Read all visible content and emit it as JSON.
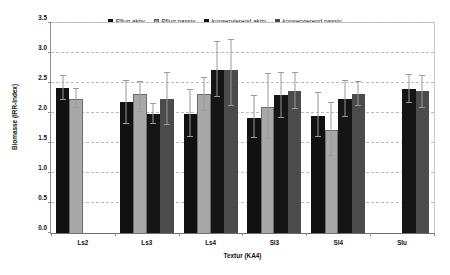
{
  "chart_data": {
    "type": "bar",
    "title": "",
    "xlabel": "Textur (KA4)",
    "ylabel": "Biomasse (IRR-Index)",
    "ylim": [
      0.0,
      3.5
    ],
    "ytick_labels": [
      "0.0",
      "0.5",
      "1.0",
      "1.5",
      "2.0",
      "2.5",
      "3.0",
      "3.5"
    ],
    "ytick_values": [
      0.0,
      0.5,
      1.0,
      1.5,
      2.0,
      2.5,
      3.0,
      3.5
    ],
    "grid": true,
    "legend_position": "top-center",
    "categories": [
      "Ls2",
      "Ls3",
      "Ls4",
      "Sl3",
      "Sl4",
      "Slu"
    ],
    "series": [
      {
        "name": "Pflug aktiv",
        "color": "#111111",
        "values": [
          2.41,
          2.18,
          1.99,
          1.92,
          1.95,
          null
        ],
        "err_upper": [
          2.61,
          2.54,
          2.39,
          2.28,
          2.33,
          null
        ],
        "err_lower": [
          2.22,
          1.81,
          1.6,
          1.58,
          1.6,
          null
        ]
      },
      {
        "name": "Pflug passiv",
        "color": "#a8a8a8",
        "values": [
          2.24,
          2.31,
          2.31,
          2.1,
          1.72,
          null
        ],
        "err_upper": [
          2.4,
          2.52,
          2.58,
          2.65,
          2.16,
          null
        ],
        "err_lower": [
          2.08,
          2.01,
          2.04,
          1.57,
          1.29,
          null
        ]
      },
      {
        "name": "konservierend aktiv",
        "color": "#151515",
        "values": [
          null,
          1.98,
          2.72,
          2.3,
          2.24,
          2.4
        ],
        "err_upper": [
          null,
          2.15,
          3.18,
          2.66,
          2.53,
          2.63
        ],
        "err_lower": [
          null,
          1.82,
          2.27,
          1.91,
          1.94,
          2.16
        ]
      },
      {
        "name": "konservierend passiv",
        "color": "#4b4b4b",
        "values": [
          null,
          2.23,
          2.72,
          2.37,
          2.32,
          2.36
        ],
        "err_upper": [
          null,
          2.66,
          3.22,
          2.67,
          2.52,
          2.62
        ],
        "err_lower": [
          null,
          1.8,
          2.12,
          2.07,
          2.11,
          2.09
        ]
      }
    ]
  }
}
